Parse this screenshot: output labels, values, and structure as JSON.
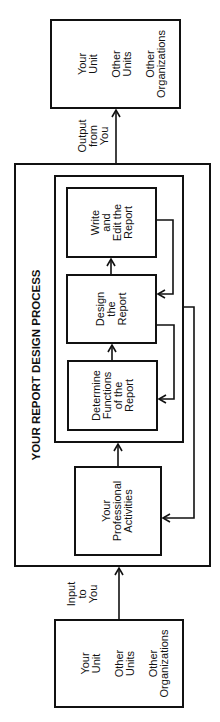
{
  "diagram": {
    "title": "YOUR REPORT DESIGN PROCESS",
    "orientation": "rotated -90deg (read bottom-to-top)",
    "nodes": {
      "input_sources": {
        "lines": [
          "Your",
          "Unit",
          "Other",
          "Units",
          "Other",
          "Organizations"
        ],
        "groups": [
          [
            "Your",
            "Unit"
          ],
          [
            "Other",
            "Units"
          ],
          [
            "Other",
            "Organizations"
          ]
        ]
      },
      "output_targets": {
        "groups": [
          [
            "Your",
            "Unit"
          ],
          [
            "Other",
            "Units"
          ],
          [
            "Other",
            "Organizations"
          ]
        ]
      },
      "professional_activities": {
        "lines": [
          "Your",
          "Professional",
          "Activities"
        ]
      },
      "determine_functions": {
        "lines": [
          "Determine",
          "Functions",
          "of the",
          "Report"
        ]
      },
      "design_report": {
        "lines": [
          "Design",
          "the",
          "Report"
        ]
      },
      "write_edit": {
        "lines": [
          "Write",
          "and",
          "Edit the",
          "Report"
        ]
      }
    },
    "edge_labels": {
      "input": [
        "Input",
        "to",
        "You"
      ],
      "output": [
        "Output",
        "from",
        "You"
      ]
    },
    "edges": [
      {
        "from": "input_sources",
        "to": "professional_activities",
        "label": "Input to You"
      },
      {
        "from": "professional_activities",
        "to": "determine_functions"
      },
      {
        "from": "determine_functions",
        "to": "design_report"
      },
      {
        "from": "design_report",
        "to": "write_edit"
      },
      {
        "from": "write_edit",
        "to": "design_report",
        "type": "feedback"
      },
      {
        "from": "design_report",
        "to": "determine_functions",
        "type": "feedback"
      },
      {
        "from": "report_group",
        "to": "professional_activities",
        "type": "feedback"
      },
      {
        "from": "process",
        "to": "output_targets",
        "label": "Output from You"
      }
    ],
    "colors": {
      "stroke": "#111111",
      "background": "#ffffff"
    }
  }
}
